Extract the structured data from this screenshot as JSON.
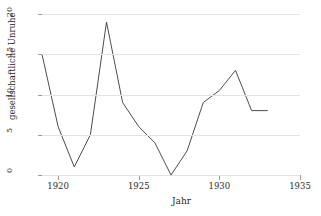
{
  "figure": {
    "title_sliver": "··· ··· ···",
    "line_color": "#4d4d4d",
    "grid_color": "#e3e3e3",
    "axis_color": "#9a9a9a"
  },
  "chart_data": {
    "type": "line",
    "title": "",
    "xlabel": "Jahr",
    "ylabel": "gesellschaftliche Unruhe",
    "xlim": [
      1919,
      1935
    ],
    "ylim": [
      0,
      20
    ],
    "xticks": [
      1920,
      1925,
      1930,
      1935
    ],
    "yticks": [
      0,
      5,
      10,
      15,
      20
    ],
    "grid": "horizontal",
    "legend": "none",
    "x": [
      1919,
      1920,
      1921,
      1922,
      1923,
      1924,
      1925,
      1926,
      1927,
      1928,
      1929,
      1930,
      1931,
      1932,
      1933
    ],
    "values": [
      15,
      6,
      1,
      5,
      19,
      9,
      6,
      4,
      0,
      3,
      9,
      10.5,
      13,
      8,
      8
    ],
    "series": [
      {
        "name": "gesellschaftliche Unruhe",
        "values": [
          15,
          6,
          1,
          5,
          19,
          9,
          6,
          4,
          0,
          3,
          9,
          10.5,
          13,
          8,
          8
        ]
      }
    ]
  }
}
